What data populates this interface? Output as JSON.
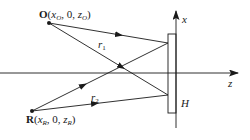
{
  "diagram": {
    "type": "holography-recording-geometry",
    "object_point": {
      "name": "O",
      "coords": [
        "x",
        "0",
        "z"
      ],
      "sub": "O",
      "label_zero": "0"
    },
    "reference_point": {
      "name": "R",
      "coords": [
        "x",
        "0",
        "z"
      ],
      "sub": "R",
      "label_zero": "0"
    },
    "rays": {
      "r1": {
        "label": "r",
        "sub": "1"
      },
      "r2": {
        "label": "r",
        "sub": "2"
      }
    },
    "axes": {
      "x_label": "x",
      "z_label": "z"
    },
    "plate_label": "H",
    "colors": {
      "line": "#1a1a1a",
      "background": "#ffffff"
    }
  }
}
